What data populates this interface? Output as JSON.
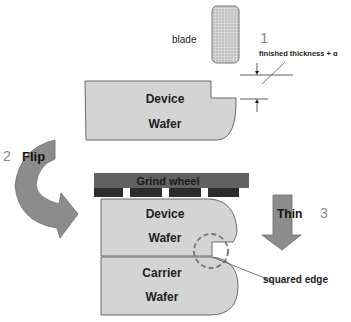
{
  "diagram": {
    "blade_label": "blade",
    "step1_number": "1",
    "thickness_label": "finished thickness + α",
    "device_wafer_top": {
      "line1": "Device",
      "line2": "Wafer"
    },
    "step2_number": "2",
    "flip_label": "Flip",
    "grind_wheel_label": "Grind wheel",
    "device_wafer_bottom": {
      "line1": "Device",
      "line2": "Wafer"
    },
    "carrier_wafer": {
      "line1": "Carrier",
      "line2": "Wafer"
    },
    "thin_label": "Thin",
    "step3_number": "3",
    "squared_edge_label": "squared edge"
  },
  "colors": {
    "wafer_fill": "#d4d4d4",
    "wafer_stroke": "#6a6a6a",
    "arrow_fill": "#8c8c8c",
    "grind_wheel": "#616161",
    "grind_teeth": "#2c2c2c",
    "blade_fill": "#c8c8c8"
  }
}
